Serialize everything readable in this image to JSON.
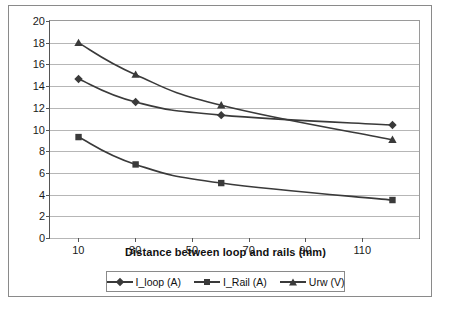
{
  "chart_data": {
    "type": "line",
    "title": "",
    "xlabel": "Distance between loop and rails (mm)",
    "ylabel": "",
    "x": [
      10,
      30,
      60,
      120
    ],
    "xlim": [
      0,
      130
    ],
    "ylim": [
      0,
      20
    ],
    "grid": true,
    "legend_position": "bottom",
    "xticks": [
      10,
      30,
      50,
      70,
      90,
      110
    ],
    "yticks": [
      0,
      2,
      4,
      6,
      8,
      10,
      12,
      14,
      16,
      18,
      20
    ],
    "series": [
      {
        "name": "I_loop (A)",
        "marker": "diamond",
        "values": [
          14.7,
          12.6,
          11.4,
          10.5
        ]
      },
      {
        "name": "I_Rail (A)",
        "marker": "square",
        "values": [
          9.4,
          6.9,
          5.2,
          3.65
        ]
      },
      {
        "name": "Urw (V)",
        "marker": "triangle",
        "values": [
          18.0,
          15.1,
          12.3,
          9.15
        ]
      }
    ],
    "colors": {
      "line": "#3a3a3a",
      "grid": "#b6b6b6",
      "axis": "#555555",
      "frame": "#8a8a8a"
    }
  },
  "yticks": {
    "t0": "0",
    "t1": "2",
    "t2": "4",
    "t3": "6",
    "t4": "8",
    "t5": "10",
    "t6": "12",
    "t7": "14",
    "t8": "16",
    "t9": "18",
    "t10": "20"
  },
  "xticks": {
    "t0": "10",
    "t1": "30",
    "t2": "50",
    "t3": "70",
    "t4": "90",
    "t5": "110"
  },
  "axis_title": "Distance between loop and rails (mm)",
  "legend": {
    "items": [
      {
        "label": "I_loop (A)"
      },
      {
        "label": "I_Rail (A)"
      },
      {
        "label": "Urw (V)"
      }
    ]
  },
  "bottom_text": ""
}
